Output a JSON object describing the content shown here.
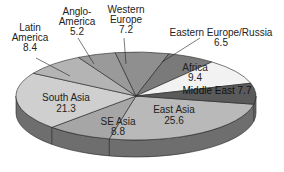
{
  "chart_data": {
    "type": "pie",
    "style": "3d-tilted",
    "title": "",
    "unit": "percent",
    "categories": [
      "East Asia",
      "SE Asia",
      "South Asia",
      "Latin America",
      "Anglo-America",
      "Western Europe",
      "Eastern Europe/Russia",
      "Africa",
      "Middle East"
    ],
    "values": [
      25.6,
      8.8,
      21.3,
      8.4,
      5.2,
      7.2,
      6.5,
      9.4,
      7.7
    ],
    "labels": [
      {
        "name": "East Asia",
        "value": "25.6"
      },
      {
        "name": "SE Asia",
        "value": "8.8"
      },
      {
        "name": "South Asia",
        "value": "21.3"
      },
      {
        "name": "Latin America",
        "value": "8.4"
      },
      {
        "name": "Anglo-America",
        "value": "5.2"
      },
      {
        "name": "Western Europe",
        "value": "7.2"
      },
      {
        "name": "Eastern Europe/Russia",
        "value": "6.5"
      },
      {
        "name": "Africa",
        "value": "9.4"
      },
      {
        "name": "Middle East",
        "value": "7.7"
      }
    ],
    "colors": {
      "East Asia": "#b9b9b9",
      "SE Asia": "#a6a6a6",
      "South Asia": "#cfcfcf",
      "Latin America": "#b4b4b4",
      "Anglo-America": "#9a9a9a",
      "Western Europe": "#8f8f8f",
      "Eastern Europe/Russia": "#7a7a7a",
      "Africa": "#f2f2f2",
      "Middle East": "#5a5a5a"
    },
    "side_color": "#6e6e6e",
    "outline_color": "#222222"
  },
  "text": {
    "latin_america_name": "Latin",
    "latin_america_name2": "America",
    "latin_america_value": "8.4",
    "anglo_america_name": "Anglo-",
    "anglo_america_name2": "America",
    "anglo_america_value": "5.2",
    "western_europe_name": "Western",
    "western_europe_name2": "Europe",
    "western_europe_value": "7.2",
    "eastern_europe_name": "Eastern Europe/Russia",
    "eastern_europe_value": "6.5",
    "africa_name": "Africa",
    "africa_value": "9.4",
    "middle_east_label": "Middle East 7.7",
    "south_asia_name": "South Asia",
    "south_asia_value": "21.3",
    "se_asia_name": "SE Asia",
    "se_asia_value": "8.8",
    "east_asia_name": "East Asia",
    "east_asia_value": "25.6"
  }
}
